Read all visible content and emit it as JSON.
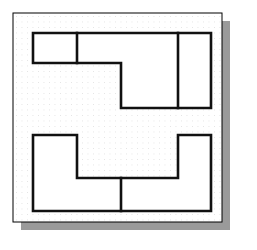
{
  "canvas": {
    "width": 257,
    "height": 250,
    "background": "#ffffff"
  },
  "paper": {
    "label": "graph-paper-sheet",
    "x": 13,
    "y": 13,
    "width": 209,
    "height": 209,
    "fill": "#ffffff",
    "border_color": "#000000",
    "border_width": 1
  },
  "shadow": {
    "label": "drop-shadow",
    "offset_x": 8,
    "offset_y": 8,
    "color": "#9a9a9a"
  },
  "grid": {
    "label": "dot-grid",
    "spacing": 5.5,
    "dot_color": "#c9c9c9",
    "dot_radius": 0.45,
    "origin_x": 16,
    "origin_y": 16,
    "cols": 36,
    "rows": 36
  },
  "style": {
    "stroke_color": "#111111",
    "stroke_width": 2.6,
    "shape_fill": "#ffffff"
  },
  "shapes": [
    {
      "name": "upper-step-shape",
      "type": "polygon",
      "points": "33,33 211,33 211,108 121,108 121,63 33,63",
      "description": "L-shaped / step outline occupying the upper half of the sheet"
    },
    {
      "name": "lower-step-shape",
      "type": "polygon",
      "points": "33,135 77,135 77,178 178,178 178,135 211,135 211,211 33,211",
      "description": "U-shaped / notched outline occupying the lower half of the sheet"
    }
  ],
  "internal_lines": [
    {
      "name": "upper-left-divider",
      "x1": 77,
      "y1": 33,
      "x2": 77,
      "y2": 63
    },
    {
      "name": "upper-right-divider",
      "x1": 178,
      "y1": 33,
      "x2": 178,
      "y2": 108
    },
    {
      "name": "lower-center-divider",
      "x1": 121,
      "y1": 178,
      "x2": 121,
      "y2": 211
    }
  ]
}
